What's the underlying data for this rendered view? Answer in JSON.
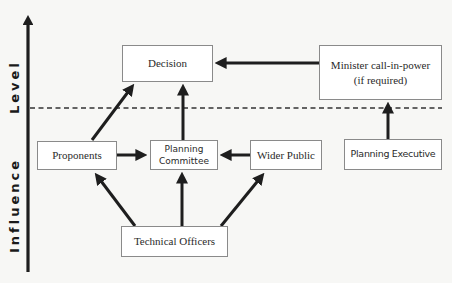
{
  "axis": {
    "label_top": "Level",
    "label_bottom": "Influence"
  },
  "divider": {
    "style": "dashed",
    "meaning": "separates decision level from influence level"
  },
  "nodes": {
    "decision": {
      "label": "Decision"
    },
    "minister": {
      "line1": "Minister call-in-power",
      "line2": "(if required)"
    },
    "proponents": {
      "label": "Proponents"
    },
    "planning_committee": {
      "line1": "Planning",
      "line2": "Committee"
    },
    "wider_public": {
      "label": "Wider Public"
    },
    "planning_executive": {
      "label": "Planning Executive"
    },
    "technical_officers": {
      "label": "Technical Officers"
    }
  },
  "edges": [
    {
      "from": "Minister call-in-power",
      "to": "Decision"
    },
    {
      "from": "Proponents",
      "to": "Decision"
    },
    {
      "from": "Planning Committee",
      "to": "Decision"
    },
    {
      "from": "Proponents",
      "to": "Planning Committee"
    },
    {
      "from": "Wider Public",
      "to": "Planning Committee"
    },
    {
      "from": "Planning Executive",
      "to": "Minister call-in-power"
    },
    {
      "from": "Technical Officers",
      "to": "Proponents"
    },
    {
      "from": "Technical Officers",
      "to": "Planning Committee"
    },
    {
      "from": "Technical Officers",
      "to": "Wider Public"
    }
  ],
  "colors": {
    "arrow": "#1e1e1e",
    "box_border": "#8a8a8a",
    "background": "#f7f7f5"
  }
}
